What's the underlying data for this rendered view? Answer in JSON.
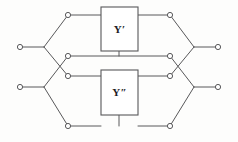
{
  "diagram": {
    "name": "lattice-two-port-network",
    "background_color": "#fdfdfc",
    "line_color": "#58585a",
    "label_color": "#1d1d1f",
    "node_fill": "#ffffff",
    "width": 238,
    "height": 142
  },
  "blocks": [
    {
      "id": "block-y-prime",
      "label": "Y′",
      "x": 101,
      "y": 7,
      "width": 37,
      "height": 44
    },
    {
      "id": "block-y-double-prime",
      "label": "Y″",
      "x": 101,
      "y": 70,
      "width": 37,
      "height": 45
    }
  ],
  "terminals": [
    {
      "id": "terminal-left-top",
      "label": "",
      "x": 20,
      "y": 47
    },
    {
      "id": "terminal-left-bottom",
      "label": "",
      "x": 20,
      "y": 87
    },
    {
      "id": "terminal-right-top",
      "label": "",
      "x": 218,
      "y": 47
    },
    {
      "id": "terminal-right-bottom",
      "label": "",
      "x": 218,
      "y": 87
    }
  ],
  "nodes": [
    {
      "id": "node-top-left",
      "x": 68,
      "y": 15
    },
    {
      "id": "node-top-right",
      "x": 170,
      "y": 15
    },
    {
      "id": "node-mid-upper-left",
      "x": 68,
      "y": 56
    },
    {
      "id": "node-mid-upper-right",
      "x": 170,
      "y": 56
    },
    {
      "id": "node-mid-lower-left",
      "x": 68,
      "y": 76
    },
    {
      "id": "node-mid-lower-right",
      "x": 170,
      "y": 76
    },
    {
      "id": "node-bottom-left",
      "x": 68,
      "y": 126
    },
    {
      "id": "node-bottom-right",
      "x": 170,
      "y": 126
    }
  ],
  "junctions": [
    {
      "id": "junction-left-top",
      "x": 44,
      "y": 47
    },
    {
      "id": "junction-left-bottom",
      "x": 44,
      "y": 87
    },
    {
      "id": "junction-right-top",
      "x": 194,
      "y": 47
    },
    {
      "id": "junction-right-bottom",
      "x": 194,
      "y": 87
    }
  ],
  "wires": {
    "lead_left_top": "M20,47 L44,47",
    "lead_left_bottom": "M20,87 L44,87",
    "lead_right_top": "M194,47 L218,47",
    "lead_right_bottom": "M194,87 L218,87",
    "branch_left_top_up": "M44,47 L68,15",
    "branch_left_top_down": "M44,47 L68,76",
    "branch_left_bottom_up": "M44,87 L68,56",
    "branch_left_bottom_down": "M44,87 L68,126",
    "branch_right_top_up": "M194,47 L170,15",
    "branch_right_top_down": "M194,47 L170,76",
    "branch_right_bottom_up": "M194,87 L170,56",
    "branch_right_bottom_down": "M194,87 L170,126",
    "rail_top_left": "M68,15 L101,15",
    "rail_top_right": "M138,15 L170,15",
    "rail_mid_upper": "M68,56 L170,56",
    "rail_mid_lower_left": "M68,76 L101,76",
    "rail_mid_lower_right": "M138,76 L170,76",
    "rail_bottom_left": "M68,126 L101,126",
    "rail_bottom_right": "M138,126 L170,126",
    "stub_top_box_down": "M119,51 L119,56",
    "stub_bottom_box_down": "M119,115 L119,126"
  },
  "geometry": {
    "node_radius": 2.6,
    "terminal_radius": 2.6
  }
}
